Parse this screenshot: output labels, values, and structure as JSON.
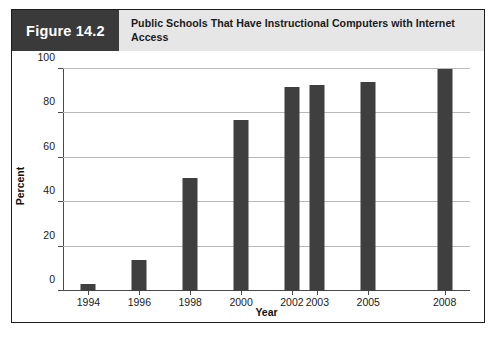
{
  "figure": {
    "label": "Figure 14.2",
    "title": "Public Schools That Have Instructional Computers with Internet Access",
    "label_block_color": "#3a3a3a",
    "title_block_color": "#e6e6e6",
    "border_color": "#1c1c1c"
  },
  "chart_data": {
    "type": "bar",
    "title": "Public Schools That Have Instructional Computers with Internet Access",
    "xlabel": "Year",
    "ylabel": "Percent",
    "categories": [
      "1994",
      "1996",
      "1998",
      "2000",
      "2002",
      "2003",
      "2005",
      "2008"
    ],
    "x": [
      1994,
      1996,
      1998,
      2000,
      2002,
      2003,
      2005,
      2008
    ],
    "values": [
      3,
      14,
      51,
      77,
      92,
      93,
      94,
      100
    ],
    "ylim": [
      0,
      100
    ],
    "xlim": [
      1993,
      2009
    ],
    "yticks": [
      0,
      20,
      40,
      60,
      80,
      100
    ],
    "ytick_labels": [
      "0",
      "20",
      "40",
      "60",
      "80",
      "100"
    ],
    "xtick_labels": [
      "1994",
      "1996",
      "1998",
      "2000",
      "2002",
      "2003",
      "2005",
      "2008"
    ],
    "grid": true,
    "grid_axis": "y",
    "legend": false,
    "bar_color": "#3f3f3f",
    "series": [
      {
        "name": "Percent of public schools with internet access",
        "values": [
          3,
          14,
          51,
          77,
          92,
          93,
          94,
          100
        ]
      }
    ]
  }
}
